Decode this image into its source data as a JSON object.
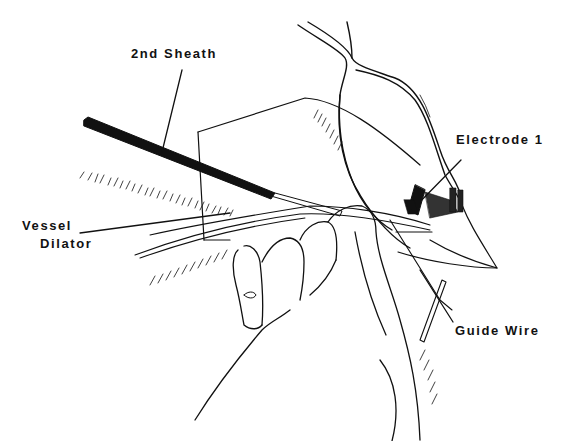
{
  "figure": {
    "type": "surgical line illustration",
    "colors": {
      "background": "#ffffff",
      "ink": "#111111"
    }
  },
  "labels": {
    "sheath": "2nd Sheath",
    "electrode": "Electrode 1",
    "vessel_line1": "Vessel",
    "vessel_line2": "Dilator",
    "guide_wire": "Guide Wire"
  }
}
